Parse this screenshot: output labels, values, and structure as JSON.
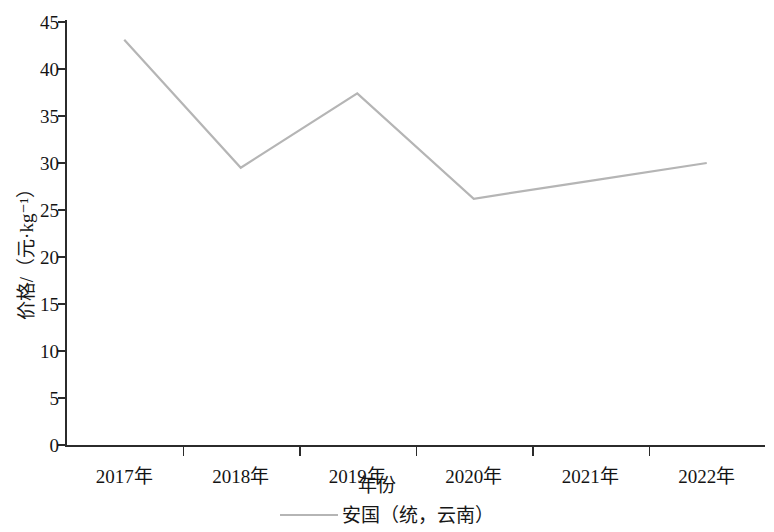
{
  "chart_data": {
    "type": "line",
    "title": "",
    "xlabel": "年份",
    "ylabel": "价格/（元·kg⁻¹）",
    "categories": [
      "2017年",
      "2018年",
      "2019年",
      "2020年",
      "2021年",
      "2022年"
    ],
    "series": [
      {
        "name": "安国（统，云南）",
        "values": [
          43.1,
          29.5,
          37.4,
          26.2,
          28.1,
          30.0
        ],
        "color": "#b5b5b5"
      }
    ],
    "ylim": [
      0,
      45
    ],
    "ytick_labels": [
      "0",
      "5",
      "10",
      "15",
      "20",
      "25",
      "30",
      "35",
      "40",
      "45"
    ],
    "ytick_values": [
      0,
      5,
      10,
      15,
      20,
      25,
      30,
      35,
      40,
      45
    ],
    "grid": false,
    "legend_position": "bottom-center",
    "legend_entries": [
      "安国（统，云南）"
    ],
    "axis_color": "#2b2b2b"
  }
}
